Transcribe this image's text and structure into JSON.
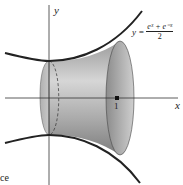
{
  "figure": {
    "y_axis_label": "y",
    "x_axis_label": "x",
    "tick_label": "1",
    "equation": {
      "lhs": "y =",
      "numerator": "eˣ + e⁻ˣ",
      "denominator": "2"
    },
    "text_fragment": "ce"
  },
  "colors": {
    "curve": "#2a2a2a",
    "surface_light": "#d8d8d8",
    "surface_dark": "#8a8a8a",
    "axis": "#333333"
  }
}
